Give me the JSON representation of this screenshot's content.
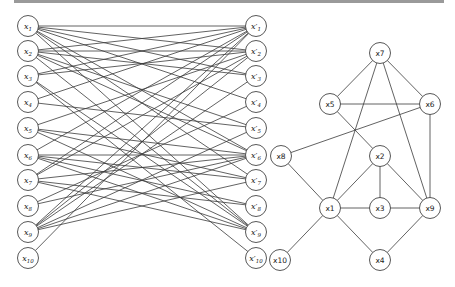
{
  "figure": {
    "left_graph": {
      "type": "bipartite",
      "left_nodes": [
        {
          "id": "x1",
          "label": "x",
          "sub": "1"
        },
        {
          "id": "x2",
          "label": "x",
          "sub": "2"
        },
        {
          "id": "x3",
          "label": "x",
          "sub": "3"
        },
        {
          "id": "x4",
          "label": "x",
          "sub": "4"
        },
        {
          "id": "x5",
          "label": "x",
          "sub": "5"
        },
        {
          "id": "x6",
          "label": "x",
          "sub": "6"
        },
        {
          "id": "x7",
          "label": "x",
          "sub": "7"
        },
        {
          "id": "x8",
          "label": "x",
          "sub": "8"
        },
        {
          "id": "x9",
          "label": "x",
          "sub": "9"
        },
        {
          "id": "x10",
          "label": "x",
          "sub": "10"
        }
      ],
      "right_nodes": [
        {
          "id": "y1",
          "label": "x′",
          "sub": "1"
        },
        {
          "id": "y2",
          "label": "x′",
          "sub": "2"
        },
        {
          "id": "y3",
          "label": "x′",
          "sub": "3"
        },
        {
          "id": "y4",
          "label": "x′",
          "sub": "4"
        },
        {
          "id": "y5",
          "label": "x′",
          "sub": "5"
        },
        {
          "id": "y6",
          "label": "x′",
          "sub": "6"
        },
        {
          "id": "y7",
          "label": "x′",
          "sub": "7"
        },
        {
          "id": "y8",
          "label": "x′",
          "sub": "8"
        },
        {
          "id": "y9",
          "label": "x′",
          "sub": "9"
        },
        {
          "id": "y10",
          "label": "x′",
          "sub": "10"
        }
      ],
      "edges": [
        [
          "x1",
          "y1"
        ],
        [
          "x1",
          "y2"
        ],
        [
          "x1",
          "y3"
        ],
        [
          "x1",
          "y6"
        ],
        [
          "x1",
          "y7"
        ],
        [
          "x1",
          "y9"
        ],
        [
          "x2",
          "y1"
        ],
        [
          "x2",
          "y2"
        ],
        [
          "x2",
          "y3"
        ],
        [
          "x2",
          "y6"
        ],
        [
          "x2",
          "y9"
        ],
        [
          "x3",
          "y1"
        ],
        [
          "x3",
          "y2"
        ],
        [
          "x3",
          "y9"
        ],
        [
          "x4",
          "y1"
        ],
        [
          "x5",
          "y2"
        ],
        [
          "x5",
          "y6"
        ],
        [
          "x5",
          "y7"
        ],
        [
          "x6",
          "y1"
        ],
        [
          "x6",
          "y6"
        ],
        [
          "x6",
          "y7"
        ],
        [
          "x6",
          "y8"
        ],
        [
          "x6",
          "y9"
        ],
        [
          "x7",
          "y2"
        ],
        [
          "x7",
          "y6"
        ],
        [
          "x7",
          "y8"
        ],
        [
          "x7",
          "y9"
        ],
        [
          "x8",
          "y4"
        ],
        [
          "x8",
          "y6"
        ],
        [
          "x9",
          "y1"
        ],
        [
          "x9",
          "y2"
        ],
        [
          "x9",
          "y3"
        ],
        [
          "x9",
          "y5"
        ],
        [
          "x9",
          "y6"
        ],
        [
          "x9",
          "y7"
        ],
        [
          "x10",
          "y1"
        ],
        [
          "x3",
          "y10"
        ],
        [
          "x1",
          "y4"
        ],
        [
          "x2",
          "y5"
        ],
        [
          "x5",
          "y9"
        ],
        [
          "x4",
          "y5"
        ],
        [
          "x7",
          "y1"
        ]
      ]
    },
    "right_graph": {
      "type": "graph",
      "nodes": [
        {
          "id": "x7",
          "label": "x7"
        },
        {
          "id": "x5",
          "label": "x5"
        },
        {
          "id": "x6",
          "label": "x6"
        },
        {
          "id": "x8",
          "label": "x8"
        },
        {
          "id": "x2",
          "label": "x2"
        },
        {
          "id": "x1",
          "label": "x1"
        },
        {
          "id": "x3",
          "label": "x3"
        },
        {
          "id": "x9",
          "label": "x9"
        },
        {
          "id": "x10",
          "label": "x10"
        },
        {
          "id": "x4",
          "label": "x4"
        }
      ],
      "edges": [
        [
          "x7",
          "x5"
        ],
        [
          "x7",
          "x6"
        ],
        [
          "x7",
          "x1"
        ],
        [
          "x7",
          "x9"
        ],
        [
          "x5",
          "x6"
        ],
        [
          "x5",
          "x2"
        ],
        [
          "x6",
          "x8"
        ],
        [
          "x6",
          "x9"
        ],
        [
          "x8",
          "x1"
        ],
        [
          "x2",
          "x1"
        ],
        [
          "x2",
          "x3"
        ],
        [
          "x2",
          "x9"
        ],
        [
          "x1",
          "x3"
        ],
        [
          "x3",
          "x9"
        ],
        [
          "x1",
          "x10"
        ],
        [
          "x1",
          "x4"
        ],
        [
          "x4",
          "x9"
        ]
      ]
    }
  }
}
